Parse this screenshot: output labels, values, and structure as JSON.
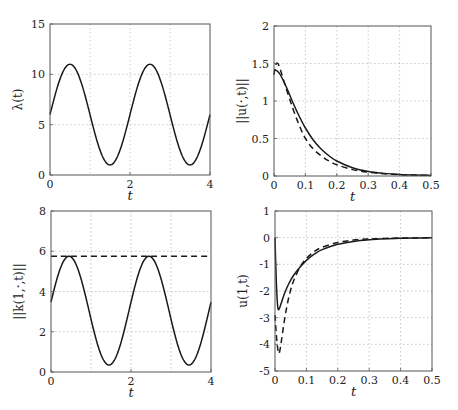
{
  "figure": {
    "layout": "2x2 grid",
    "background": "#ffffff",
    "line_color": "#1a1a1a",
    "grid_color": "#bbbbbb"
  },
  "chart_data": [
    {
      "id": "lambda",
      "type": "line",
      "title": "",
      "xlabel": "t",
      "ylabel": "λ(t)",
      "xlim": [
        0,
        4
      ],
      "ylim": [
        0,
        15
      ],
      "xticks": [
        0,
        2,
        4
      ],
      "xtick_labels": [
        "0",
        "2",
        "4"
      ],
      "xgrid": [
        1,
        2,
        3
      ],
      "yticks": [
        0,
        5,
        10,
        15
      ],
      "ytick_labels": [
        "0",
        "5",
        "10",
        "15"
      ],
      "grid": true,
      "box": {
        "left": 50,
        "top": 24,
        "right": 210,
        "bottom": 175
      },
      "series": [
        {
          "name": "lambda",
          "style": "solid",
          "formula": "6 + 5*sin(pi*t)",
          "x": [
            0,
            0.25,
            0.5,
            0.75,
            1.0,
            1.25,
            1.5,
            1.75,
            2.0,
            2.25,
            2.5,
            2.75,
            3.0,
            3.25,
            3.5,
            3.75,
            4.0
          ],
          "y": [
            6,
            9.54,
            11,
            9.54,
            6,
            2.46,
            1,
            2.46,
            6,
            9.54,
            11,
            9.54,
            6,
            2.46,
            1,
            2.46,
            6
          ]
        }
      ]
    },
    {
      "id": "u-norm",
      "type": "line",
      "title": "",
      "xlabel": "t",
      "ylabel": "||u(·,t)||",
      "xlim": [
        0,
        0.5
      ],
      "ylim": [
        0,
        2
      ],
      "xticks": [
        0,
        0.1,
        0.2,
        0.3,
        0.4,
        0.5
      ],
      "xtick_labels": [
        "0",
        "0.1",
        "0.2",
        "0.3",
        "0.4",
        "0.5"
      ],
      "xgrid": [
        0.1,
        0.2,
        0.3,
        0.4
      ],
      "yticks": [
        0,
        0.5,
        1,
        1.5,
        2
      ],
      "ytick_labels": [
        "0",
        "0.5",
        "1",
        "1.5",
        "2"
      ],
      "grid": true,
      "box": {
        "left": 274,
        "top": 26,
        "right": 431,
        "bottom": 176
      },
      "series": [
        {
          "name": "solid",
          "style": "solid",
          "x": [
            0,
            0.01,
            0.02,
            0.04,
            0.06,
            0.08,
            0.1,
            0.125,
            0.15,
            0.175,
            0.2,
            0.25,
            0.3,
            0.35,
            0.4,
            0.45,
            0.5
          ],
          "y": [
            1.42,
            1.4,
            1.35,
            1.18,
            0.98,
            0.8,
            0.64,
            0.48,
            0.36,
            0.27,
            0.2,
            0.11,
            0.06,
            0.035,
            0.02,
            0.012,
            0.008
          ]
        },
        {
          "name": "dashed",
          "style": "dashed",
          "x": [
            0,
            0.005,
            0.012,
            0.02,
            0.04,
            0.06,
            0.08,
            0.1,
            0.125,
            0.15,
            0.175,
            0.2,
            0.25,
            0.3,
            0.35,
            0.4,
            0.45,
            0.5
          ],
          "y": [
            1.35,
            1.48,
            1.5,
            1.42,
            1.15,
            0.9,
            0.68,
            0.5,
            0.36,
            0.27,
            0.2,
            0.15,
            0.085,
            0.05,
            0.03,
            0.018,
            0.012,
            0.008
          ]
        }
      ]
    },
    {
      "id": "k-norm",
      "type": "line",
      "title": "",
      "xlabel": "t",
      "ylabel": "||k(1,·,t)||",
      "xlim": [
        0,
        4
      ],
      "ylim": [
        0,
        8
      ],
      "xticks": [
        0,
        2,
        4
      ],
      "xtick_labels": [
        "0",
        "2",
        "4"
      ],
      "xgrid": [
        1,
        2,
        3
      ],
      "yticks": [
        0,
        2,
        4,
        6,
        8
      ],
      "ytick_labels": [
        "0",
        "2",
        "4",
        "6",
        "8"
      ],
      "grid": true,
      "box": {
        "left": 51,
        "top": 211,
        "right": 211,
        "bottom": 372
      },
      "series": [
        {
          "name": "solid",
          "style": "solid",
          "formula": "approx 3.05 + 2.7*sin(pi*t)",
          "x": [
            0,
            0.25,
            0.45,
            0.5,
            0.75,
            1.0,
            1.25,
            1.45,
            1.5,
            1.75,
            2.0,
            2.25,
            2.45,
            2.5,
            2.75,
            3.0,
            3.25,
            3.45,
            3.5,
            3.75,
            4.0
          ],
          "y": [
            2.8,
            4.9,
            5.75,
            5.72,
            4.9,
            3.1,
            1.1,
            0.35,
            0.36,
            1.2,
            2.8,
            4.9,
            5.75,
            5.72,
            4.9,
            3.1,
            1.1,
            0.35,
            0.36,
            1.2,
            2.8
          ]
        },
        {
          "name": "dashed-bound",
          "style": "dashed",
          "x": [
            0,
            4
          ],
          "y": [
            5.75,
            5.75
          ]
        }
      ]
    },
    {
      "id": "u-boundary",
      "type": "line",
      "title": "",
      "xlabel": "t",
      "ylabel": "u(1,t)",
      "xlim": [
        0,
        0.5
      ],
      "ylim": [
        -5,
        1
      ],
      "xticks": [
        0,
        0.1,
        0.2,
        0.3,
        0.4,
        0.5
      ],
      "xtick_labels": [
        "0",
        "0.1",
        "0.2",
        "0.3",
        "0.4",
        "0.5"
      ],
      "xgrid": [
        0.1,
        0.2,
        0.3,
        0.4
      ],
      "yticks": [
        -5,
        -4,
        -3,
        -2,
        -1,
        0,
        1
      ],
      "ytick_labels": [
        "-5",
        "-4",
        "-3",
        "-2",
        "-1",
        "0",
        "1"
      ],
      "grid": true,
      "box": {
        "left": 275,
        "top": 211,
        "right": 432,
        "bottom": 371
      },
      "series": [
        {
          "name": "solid",
          "style": "solid",
          "x": [
            0,
            0.004,
            0.008,
            0.012,
            0.02,
            0.03,
            0.045,
            0.06,
            0.08,
            0.1,
            0.125,
            0.15,
            0.2,
            0.25,
            0.3,
            0.35,
            0.4,
            0.45,
            0.5
          ],
          "y": [
            0,
            -1.6,
            -2.5,
            -2.7,
            -2.45,
            -2.1,
            -1.7,
            -1.4,
            -1.1,
            -0.85,
            -0.62,
            -0.45,
            -0.25,
            -0.14,
            -0.08,
            -0.045,
            -0.025,
            -0.012,
            -0.005
          ]
        },
        {
          "name": "dashed",
          "style": "dashed",
          "x": [
            0,
            0.004,
            0.008,
            0.012,
            0.016,
            0.02,
            0.03,
            0.04,
            0.05,
            0.06,
            0.08,
            0.1,
            0.125,
            0.15,
            0.2,
            0.25,
            0.3,
            0.35,
            0.4,
            0.45,
            0.5
          ],
          "y": [
            -2.9,
            -3.6,
            -4.1,
            -4.35,
            -4.2,
            -3.9,
            -3.1,
            -2.45,
            -1.95,
            -1.6,
            -1.1,
            -0.78,
            -0.52,
            -0.36,
            -0.18,
            -0.09,
            -0.05,
            -0.03,
            -0.015,
            -0.008,
            -0.004
          ]
        }
      ]
    }
  ]
}
